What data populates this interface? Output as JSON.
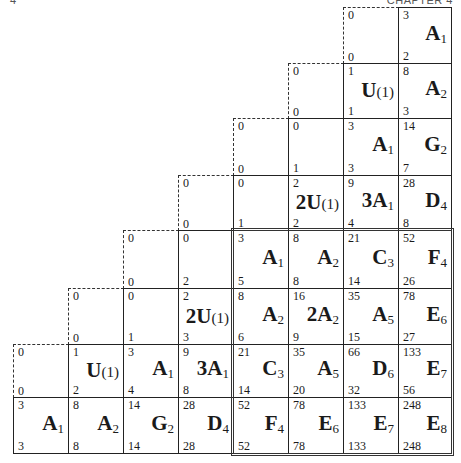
{
  "header": {
    "right": "CHAPTER 4",
    "left": "4"
  },
  "grid": {
    "rows": 8,
    "cols": 8,
    "note": "row 0 is top; each cell has top number, bottom number, and label (letter + subscript)",
    "cells": [
      {
        "r": 0,
        "c": 6,
        "top": "0",
        "bottom": "0",
        "type": "dashed"
      },
      {
        "r": 0,
        "c": 7,
        "top": "3",
        "bottom": "2",
        "main": "A",
        "sub": "1"
      },
      {
        "r": 1,
        "c": 5,
        "top": "0",
        "bottom": "0",
        "type": "dashed"
      },
      {
        "r": 1,
        "c": 6,
        "top": "1",
        "bottom": "1",
        "main": "U",
        "paren": "(1)"
      },
      {
        "r": 1,
        "c": 7,
        "top": "8",
        "bottom": "3",
        "main": "A",
        "sub": "2"
      },
      {
        "r": 2,
        "c": 4,
        "top": "0",
        "bottom": "0",
        "type": "dashed"
      },
      {
        "r": 2,
        "c": 5,
        "top": "0",
        "bottom": "1"
      },
      {
        "r": 2,
        "c": 6,
        "top": "3",
        "bottom": "3",
        "main": "A",
        "sub": "1"
      },
      {
        "r": 2,
        "c": 7,
        "top": "14",
        "bottom": "7",
        "main": "G",
        "sub": "2"
      },
      {
        "r": 3,
        "c": 3,
        "top": "0",
        "bottom": "0",
        "type": "dashed"
      },
      {
        "r": 3,
        "c": 4,
        "top": "0",
        "bottom": "1"
      },
      {
        "r": 3,
        "c": 5,
        "top": "2",
        "bottom": "2",
        "main": "2U",
        "paren": "(1)"
      },
      {
        "r": 3,
        "c": 6,
        "top": "9",
        "bottom": "4",
        "main": "3A",
        "sub": "1"
      },
      {
        "r": 3,
        "c": 7,
        "top": "28",
        "bottom": "8",
        "main": "D",
        "sub": "4"
      },
      {
        "r": 4,
        "c": 2,
        "top": "0",
        "bottom": "0",
        "type": "dashed"
      },
      {
        "r": 4,
        "c": 3,
        "top": "0",
        "bottom": "2"
      },
      {
        "r": 4,
        "c": 4,
        "top": "3",
        "bottom": "5",
        "main": "A",
        "sub": "1"
      },
      {
        "r": 4,
        "c": 5,
        "top": "8",
        "bottom": "8",
        "main": "A",
        "sub": "2"
      },
      {
        "r": 4,
        "c": 6,
        "top": "21",
        "bottom": "14",
        "main": "C",
        "sub": "3"
      },
      {
        "r": 4,
        "c": 7,
        "top": "52",
        "bottom": "26",
        "main": "F",
        "sub": "4"
      },
      {
        "r": 5,
        "c": 1,
        "top": "0",
        "bottom": "0",
        "type": "dashed"
      },
      {
        "r": 5,
        "c": 2,
        "top": "0",
        "bottom": "1"
      },
      {
        "r": 5,
        "c": 3,
        "top": "2",
        "bottom": "3",
        "main": "2U",
        "paren": "(1)"
      },
      {
        "r": 5,
        "c": 4,
        "top": "8",
        "bottom": "6",
        "main": "A",
        "sub": "2"
      },
      {
        "r": 5,
        "c": 5,
        "top": "16",
        "bottom": "9",
        "main": "2A",
        "sub": "2"
      },
      {
        "r": 5,
        "c": 6,
        "top": "35",
        "bottom": "15",
        "main": "A",
        "sub": "5"
      },
      {
        "r": 5,
        "c": 7,
        "top": "78",
        "bottom": "27",
        "main": "E",
        "sub": "6"
      },
      {
        "r": 6,
        "c": 0,
        "top": "0",
        "bottom": "0",
        "type": "dashed"
      },
      {
        "r": 6,
        "c": 1,
        "top": "1",
        "bottom": "2",
        "main": "U",
        "paren": "(1)"
      },
      {
        "r": 6,
        "c": 2,
        "top": "3",
        "bottom": "4",
        "main": "A",
        "sub": "1"
      },
      {
        "r": 6,
        "c": 3,
        "top": "9",
        "bottom": "8",
        "main": "3A",
        "sub": "1"
      },
      {
        "r": 6,
        "c": 4,
        "top": "21",
        "bottom": "14",
        "main": "C",
        "sub": "3"
      },
      {
        "r": 6,
        "c": 5,
        "top": "35",
        "bottom": "20",
        "main": "A",
        "sub": "5"
      },
      {
        "r": 6,
        "c": 6,
        "top": "66",
        "bottom": "32",
        "main": "D",
        "sub": "6"
      },
      {
        "r": 6,
        "c": 7,
        "top": "133",
        "bottom": "56",
        "main": "E",
        "sub": "7"
      },
      {
        "r": 7,
        "c": 0,
        "top": "3",
        "bottom": "3",
        "main": "A",
        "sub": "1"
      },
      {
        "r": 7,
        "c": 1,
        "top": "8",
        "bottom": "8",
        "main": "A",
        "sub": "2"
      },
      {
        "r": 7,
        "c": 2,
        "top": "14",
        "bottom": "14",
        "main": "G",
        "sub": "2"
      },
      {
        "r": 7,
        "c": 3,
        "top": "28",
        "bottom": "28",
        "main": "D",
        "sub": "4"
      },
      {
        "r": 7,
        "c": 4,
        "top": "52",
        "bottom": "52",
        "main": "F",
        "sub": "4"
      },
      {
        "r": 7,
        "c": 5,
        "top": "78",
        "bottom": "78",
        "main": "E",
        "sub": "6"
      },
      {
        "r": 7,
        "c": 6,
        "top": "133",
        "bottom": "133",
        "main": "E",
        "sub": "7"
      },
      {
        "r": 7,
        "c": 7,
        "top": "248",
        "bottom": "248",
        "main": "E",
        "sub": "8"
      }
    ],
    "double_border_region": {
      "r0": 4,
      "c0": 4,
      "r1": 7,
      "c1": 7
    }
  }
}
